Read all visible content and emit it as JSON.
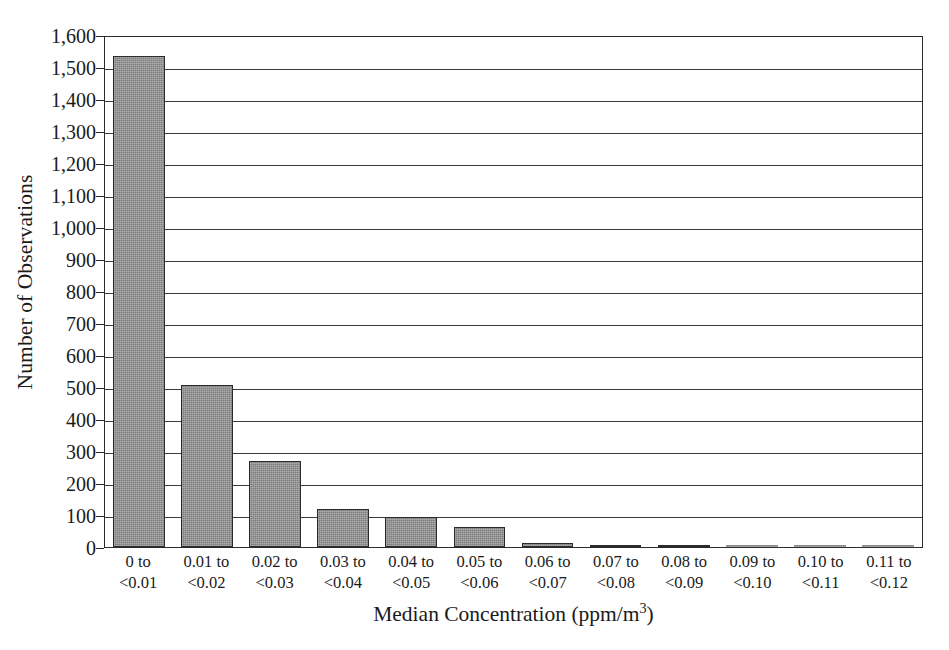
{
  "chart_data": {
    "type": "bar",
    "title": "",
    "xlabel": "Median Concentration (ppm/m3)",
    "xlabel_base": "Median Concentration (ppm/m",
    "xlabel_sup": "3",
    "xlabel_tail": ")",
    "ylabel": "Number of Observations",
    "categories": [
      "0 to\n<0.01",
      "0.01 to\n<0.02",
      "0.02 to\n<0.03",
      "0.03 to\n<0.04",
      "0.04 to\n<0.05",
      "0.05 to\n<0.06",
      "0.06 to\n<0.07",
      "0.07 to\n<0.08",
      "0.08 to\n<0.09",
      "0.09 to\n<0.10",
      "0.10 to\n<0.11",
      "0.11 to\n<0.12"
    ],
    "category_lines": [
      [
        "0 to",
        "<0.01"
      ],
      [
        "0.01 to",
        "<0.02"
      ],
      [
        "0.02 to",
        "<0.03"
      ],
      [
        "0.03 to",
        "<0.04"
      ],
      [
        "0.04 to",
        "<0.05"
      ],
      [
        "0.05 to",
        "<0.06"
      ],
      [
        "0.06 to",
        "<0.07"
      ],
      [
        "0.07 to",
        "<0.08"
      ],
      [
        "0.08 to",
        "<0.09"
      ],
      [
        "0.09 to",
        "<0.10"
      ],
      [
        "0.10 to",
        "<0.11"
      ],
      [
        "0.11 to",
        "<0.12"
      ]
    ],
    "values": [
      1535,
      505,
      270,
      120,
      95,
      62,
      12,
      6,
      2,
      0,
      0,
      0
    ],
    "ylim": [
      0,
      1600
    ],
    "ytick_step": 100,
    "ytick_labels": [
      "1,600",
      "1,500",
      "1,400",
      "1,300",
      "1,200",
      "1,100",
      "1,000",
      "900",
      "800",
      "700",
      "600",
      "500",
      "400",
      "300",
      "200",
      "100",
      "0"
    ],
    "ytick_values": [
      1600,
      1500,
      1400,
      1300,
      1200,
      1100,
      1000,
      900,
      800,
      700,
      600,
      500,
      400,
      300,
      200,
      100,
      0
    ],
    "grid": true,
    "grid_axis": "y",
    "legend": false,
    "legend_position": "none",
    "bar_color": "#7d7d7d",
    "bar_border_color": "#2b2b2b",
    "axis_color": "#2b2b2b",
    "background_color": "#ffffff"
  }
}
